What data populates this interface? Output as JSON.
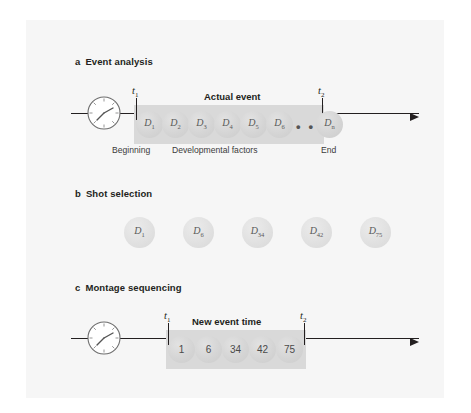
{
  "figure": {
    "background_color": "#f6f6f6",
    "sections": [
      {
        "letter": "a",
        "title": "Event analysis",
        "band_title": "Actual event",
        "t_start": "t",
        "t_start_sub": "1",
        "t_end": "t",
        "t_end_sub": "2",
        "clock_icon": "clock-icon",
        "arrow_icon": "arrow-right-icon",
        "discs": [
          {
            "base": "D",
            "sub": "1"
          },
          {
            "base": "D",
            "sub": "2"
          },
          {
            "base": "D",
            "sub": "3"
          },
          {
            "base": "D",
            "sub": "4"
          },
          {
            "base": "D",
            "sub": "5"
          },
          {
            "base": "D",
            "sub": "6"
          },
          {
            "base": "D",
            "sub": "n"
          }
        ],
        "ellipsis": "• • •",
        "captions": {
          "left": "Beginning",
          "center": "Developmental factors",
          "right": "End"
        }
      },
      {
        "letter": "b",
        "title": "Shot selection",
        "discs": [
          {
            "base": "D",
            "sub": "1"
          },
          {
            "base": "D",
            "sub": "6"
          },
          {
            "base": "D",
            "sub": "34"
          },
          {
            "base": "D",
            "sub": "42"
          },
          {
            "base": "D",
            "sub": "75"
          }
        ]
      },
      {
        "letter": "c",
        "title": "Montage sequencing",
        "band_title": "New event time",
        "t_start": "t",
        "t_start_sub": "1",
        "t_end": "t",
        "t_end_sub": "2",
        "clock_icon": "clock-icon",
        "arrow_icon": "arrow-right-icon",
        "discs": [
          {
            "num": "1"
          },
          {
            "num": "6"
          },
          {
            "num": "34"
          },
          {
            "num": "42"
          },
          {
            "num": "75"
          }
        ]
      }
    ]
  }
}
